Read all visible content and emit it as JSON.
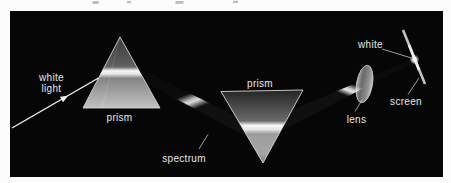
{
  "diagram": {
    "type": "optics-white-light-dispersion-and-recombination",
    "labels": {
      "white_light": {
        "line1": "white",
        "line2": "light"
      },
      "prism_left": "prism",
      "spectrum": "spectrum",
      "prism_right": "prism",
      "lens": "lens",
      "white_spot": "white",
      "screen": "screen"
    },
    "colors": {
      "page_background": "#fcfcfc",
      "panel_background": "#060606",
      "label_text": "#e6e6e6",
      "beam": "#ffffff",
      "prism_outline": "#d6d6d6",
      "screen_bar": "#c2c2c2"
    }
  }
}
